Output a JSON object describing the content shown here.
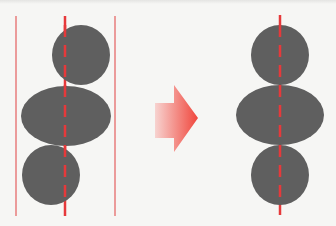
{
  "diagram": {
    "colors": {
      "background": "#f6f6f4",
      "shape_fill": "#5f5f5f",
      "guide_red": "#e6393b",
      "border_red": "#e56a6a",
      "arrow_start": "#f7d3d0",
      "arrow_end": "#f0463c"
    },
    "left_panel": {
      "label": "before",
      "border_lines_x": [
        16,
        115
      ],
      "center_line_x": 65,
      "line_y_range": [
        16,
        216
      ],
      "shapes": [
        {
          "name": "top-circle",
          "cx": 81,
          "cy": 55,
          "rx": 29,
          "ry": 30
        },
        {
          "name": "middle-ellipse",
          "cx": 66,
          "cy": 116,
          "rx": 45,
          "ry": 30
        },
        {
          "name": "bottom-circle",
          "cx": 51,
          "cy": 175,
          "rx": 29,
          "ry": 30
        }
      ]
    },
    "arrow": {
      "direction": "right",
      "shaft": {
        "x": 155,
        "y": 103,
        "w": 20,
        "h": 35
      },
      "head": {
        "x0": 174,
        "y_top": 85,
        "y_bottom": 152,
        "tip_x": 198,
        "tip_y": 118
      }
    },
    "right_panel": {
      "label": "after",
      "center_line_x": 280,
      "line_y_range": [
        15,
        215
      ],
      "shapes": [
        {
          "name": "top-circle",
          "cx": 280,
          "cy": 55,
          "rx": 29,
          "ry": 30
        },
        {
          "name": "middle-ellipse",
          "cx": 280,
          "cy": 115,
          "rx": 44,
          "ry": 30
        },
        {
          "name": "bottom-circle",
          "cx": 280,
          "cy": 175,
          "rx": 29,
          "ry": 30
        }
      ]
    }
  }
}
